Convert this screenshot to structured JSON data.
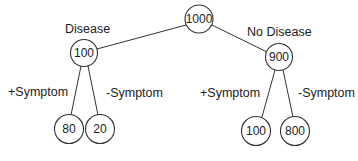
{
  "tree": {
    "root": {
      "value": "1000"
    },
    "branches": {
      "left": {
        "label": "Disease",
        "value": "100"
      },
      "right": {
        "label": "No Disease",
        "value": "900"
      }
    },
    "leaves": {
      "left_pos": {
        "label": "+Symptom",
        "value": "80"
      },
      "left_neg": {
        "label": "-Symptom",
        "value": "20"
      },
      "right_pos": {
        "label": "+Symptom",
        "value": "100"
      },
      "right_neg": {
        "label": "-Symptom",
        "value": "800"
      }
    }
  }
}
